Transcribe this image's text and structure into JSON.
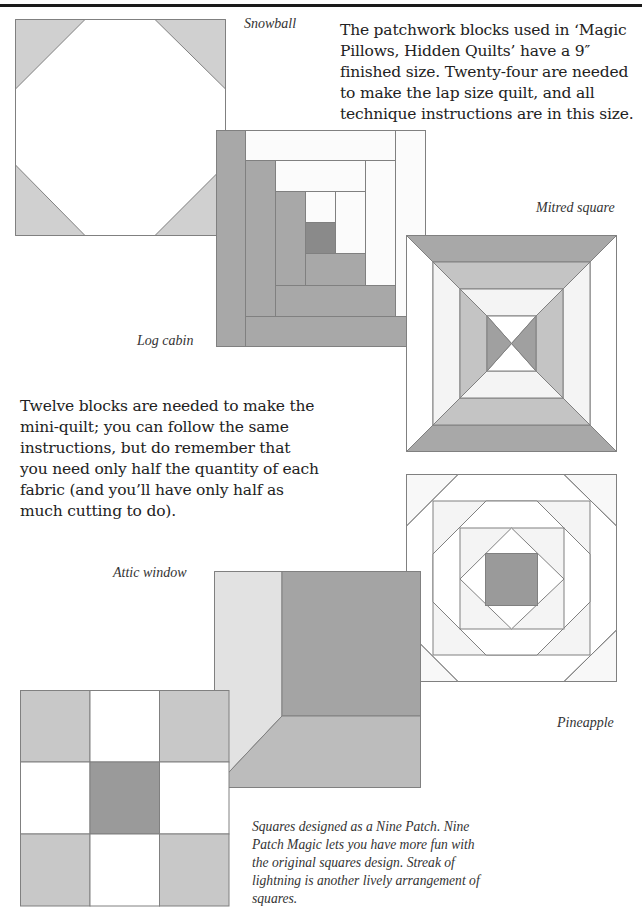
{
  "page": {
    "intro_text": "The patchwork blocks used in ‘Magic Pillows, Hidden Quilts’ have a 9″ finished size. Twenty-four are needed to make the lap size quilt, and all technique instructions are in this size.",
    "mini_quilt_text": "Twelve blocks are needed to make the mini-quilt; you can follow the same instructions, but do remember that you need only half the quantity of each fabric (and you’ll have only half as much cutting to do).",
    "nine_patch_note": "Squares designed as a Nine Patch. Nine Patch Magic lets you have more fun with the original squares design. Streak of lightning is another lively arrangement of squares."
  },
  "colors": {
    "light": "#d0d0d0",
    "medium": "#b4b4b4",
    "dark": "#9a9a9a",
    "darkest": "#8a8a8a",
    "white": "#ffffff",
    "paper_white": "#fbfbfb",
    "outline": "#808080"
  },
  "blocks": [
    {
      "id": "snowball",
      "caption": "Snowball"
    },
    {
      "id": "log-cabin",
      "caption": "Log cabin"
    },
    {
      "id": "mitred-square",
      "caption": "Mitred square"
    },
    {
      "id": "pineapple",
      "caption": "Pineapple"
    },
    {
      "id": "attic-window",
      "caption": "Attic window"
    },
    {
      "id": "nine-patch",
      "caption": ""
    }
  ]
}
